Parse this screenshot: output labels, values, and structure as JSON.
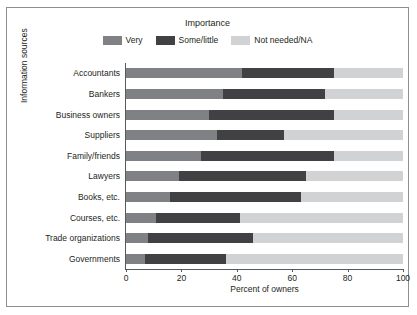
{
  "chart_data": {
    "type": "bar",
    "orientation": "horizontal",
    "stacked": true,
    "stack_total": 100,
    "title": "",
    "legend_title": "Importance",
    "legend_position": "top-center",
    "xlabel": "Percent of owners",
    "ylabel": "Information sources",
    "xlim": [
      0,
      100
    ],
    "xticks": [
      0,
      20,
      40,
      60,
      80,
      100
    ],
    "xtick_labels": [
      "0",
      "20",
      "40",
      "60",
      "80",
      "100"
    ],
    "grid": false,
    "categories": [
      "Accountants",
      "Bankers",
      "Business owners",
      "Suppliers",
      "Family/friends",
      "Lawyers",
      "Books, etc.",
      "Courses, etc.",
      "Trade organizations",
      "Governments"
    ],
    "series": [
      {
        "name": "Very",
        "color": "#808184",
        "values": [
          42,
          35,
          30,
          33,
          27,
          19,
          16,
          11,
          8,
          7
        ]
      },
      {
        "name": "Some/little",
        "color": "#414042",
        "values": [
          33,
          37,
          45,
          24,
          48,
          46,
          47,
          30,
          38,
          29
        ]
      },
      {
        "name": "Not needed/NA",
        "color": "#d0d2d3",
        "values": [
          25,
          28,
          25,
          43,
          25,
          35,
          37,
          59,
          54,
          64
        ]
      }
    ]
  },
  "legend": {
    "title": "Importance",
    "items": [
      {
        "label": "Very",
        "color": "#808184"
      },
      {
        "label": "Some/little",
        "color": "#414042"
      },
      {
        "label": "Not needed/NA",
        "color": "#d0d2d3"
      }
    ]
  },
  "axes": {
    "x_title": "Percent of owners",
    "y_title": "Information sources"
  },
  "colors": {
    "border": "#8e8e8e",
    "axis": "#58595b",
    "text": "#231f20",
    "background": "#ffffff"
  }
}
